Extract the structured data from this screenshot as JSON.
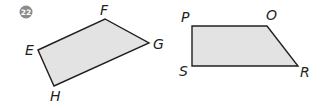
{
  "problem": {
    "number": "22",
    "badge_color": "#8c8c8c"
  },
  "figures": [
    {
      "name": "quadrilateral-EFGH",
      "fill": "#e3e3e3",
      "stroke": "#231f20",
      "vertices": [
        {
          "label": "E"
        },
        {
          "label": "F"
        },
        {
          "label": "G"
        },
        {
          "label": "H"
        }
      ]
    },
    {
      "name": "quadrilateral-POSR",
      "fill": "#e3e3e3",
      "stroke": "#231f20",
      "vertices": [
        {
          "label": "P"
        },
        {
          "label": "O"
        },
        {
          "label": "R"
        },
        {
          "label": "S"
        }
      ]
    }
  ]
}
